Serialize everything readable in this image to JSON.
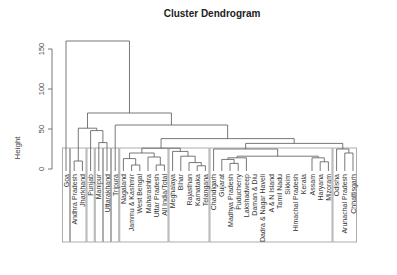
{
  "chart_data": {
    "type": "dendrogram",
    "title": "Cluster Dendrogram",
    "xlabel": "",
    "ylabel": "Height",
    "ylim": [
      0,
      160
    ],
    "yticks": [
      0,
      50,
      100,
      150
    ],
    "grid": false,
    "leaves": [
      "Goa",
      "Andhra Pradesh",
      "Jharkhand",
      "Punjab",
      "Manipur",
      "Uttarakhand",
      "Tripura",
      "Nagaland",
      "Jammu & Kashmir",
      "West Bengal",
      "Maharashtra",
      "Uttar Pradesh",
      "All India/Total",
      "Meghalaya",
      "Bihar",
      "Rajasthan",
      "Karnataka",
      "Telangana",
      "Chandigarh",
      "Gujarat",
      "Madhya Pradesh",
      "Puducherry",
      "Lakshadweep",
      "Daman & Diu",
      "Dadra & Nagar Haveli",
      "A & N Island",
      "Tamil Nadu",
      "Sikkim",
      "Himachal Pradesh",
      "Kerala",
      "Assam",
      "Haryana",
      "Mizoram",
      "Odisha",
      "Arunachal Pradesh",
      "Chhattisgarh"
    ],
    "merges": [
      {
        "a": 1,
        "b": 2,
        "height": 10
      },
      {
        "a": 4,
        "b": 5,
        "height": 33
      },
      {
        "a": 3,
        "b": "m2",
        "height": 48
      },
      {
        "a": "m1",
        "b": "m3",
        "height": 51
      },
      {
        "a": 8,
        "b": 9,
        "height": 5
      },
      {
        "a": 7,
        "b": "m5",
        "height": 13
      },
      {
        "a": 11,
        "b": 12,
        "height": 5
      },
      {
        "a": 10,
        "b": "m7",
        "height": 15
      },
      {
        "a": "m6",
        "b": "m8",
        "height": 20
      },
      {
        "a": 16,
        "b": 17,
        "height": 4
      },
      {
        "a": 15,
        "b": "m10",
        "height": 8
      },
      {
        "a": 14,
        "b": "m11",
        "height": 16
      },
      {
        "a": 13,
        "b": "m12",
        "height": 22
      },
      {
        "a": "m9",
        "b": "m13",
        "height": 26
      },
      {
        "a": 20,
        "b": 21,
        "height": 7
      },
      {
        "a": 19,
        "b": "m15",
        "height": 12
      },
      {
        "a": "m16",
        "b": 22,
        "height": 14
      },
      {
        "a": 31,
        "b": 32,
        "height": 9
      },
      {
        "a": 30,
        "b": "m18",
        "height": 14
      },
      {
        "a": "m17",
        "b": "m19",
        "height": 16
      },
      {
        "a": 18,
        "b": "m20",
        "height": 25
      },
      {
        "a": 34,
        "b": 35,
        "height": 20
      },
      {
        "a": 33,
        "b": "m22",
        "height": 25
      },
      {
        "a": "m21",
        "b": "m23",
        "height": 32
      },
      {
        "a": "m14",
        "b": "m24",
        "height": 38
      },
      {
        "a": 6,
        "b": "m25",
        "height": 55
      },
      {
        "a": "m4",
        "b": "m26",
        "height": 70
      },
      {
        "a": 0,
        "b": "m27",
        "height": 160
      }
    ],
    "cluster_boxes": [
      {
        "from": 0,
        "to": 0
      },
      {
        "from": 1,
        "to": 2
      },
      {
        "from": 3,
        "to": 3
      },
      {
        "from": 4,
        "to": 4
      },
      {
        "from": 5,
        "to": 5
      },
      {
        "from": 6,
        "to": 6
      },
      {
        "from": 7,
        "to": 12
      },
      {
        "from": 13,
        "to": 17
      },
      {
        "from": 18,
        "to": 32
      },
      {
        "from": 33,
        "to": 35
      }
    ]
  },
  "ui": {
    "title": "Cluster Dendrogram",
    "ylabel": "Height",
    "tick_labels": [
      "0",
      "50",
      "100",
      "150"
    ]
  }
}
